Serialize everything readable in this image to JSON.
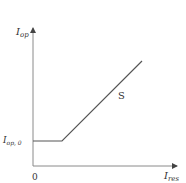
{
  "diagram": {
    "type": "characteristic-curve",
    "y_axis": {
      "label_main": "I",
      "label_sub": "op"
    },
    "x_axis": {
      "label_main": "I",
      "label_sub": "res"
    },
    "origin_label": "0",
    "threshold_label": {
      "main": "I",
      "sub": "op, 0"
    },
    "slope_label": "S",
    "colors": {
      "axis": "#777777",
      "curve": "#555555",
      "text": "#333333"
    }
  }
}
